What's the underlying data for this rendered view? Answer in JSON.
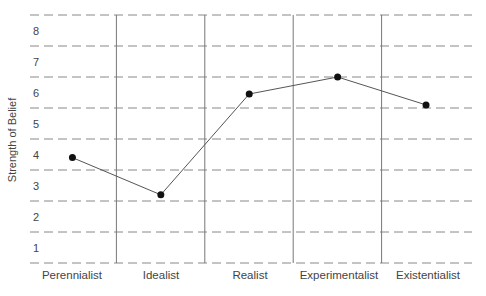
{
  "chart_data": {
    "type": "line",
    "title": "",
    "xlabel": "",
    "ylabel": "Strength of Belief",
    "categories": [
      "Perennialist",
      "Idealist",
      "Realist",
      "Experimentalist",
      "Existentialist"
    ],
    "values": [
      3.9,
      2.7,
      5.95,
      6.5,
      5.6
    ],
    "yticks": [
      "1",
      "2",
      "3",
      "4",
      "5",
      "6",
      "7",
      "8"
    ],
    "ylim": [
      0.5,
      8.5
    ],
    "grid": {
      "horizontal": "dashed",
      "vertical": "solid-category-dividers"
    },
    "legend": null,
    "colors": {
      "line": "#555555",
      "marker": "#111111",
      "grid": "#888888",
      "divider": "#777777"
    }
  },
  "axis": {
    "ylabel": "Strength of Belief",
    "ticks": [
      "8",
      "7",
      "6",
      "5",
      "4",
      "3",
      "2",
      "1"
    ],
    "categories": [
      "Perennialist",
      "Idealist",
      "Realist",
      "Experimentalist",
      "Existentialist"
    ]
  }
}
